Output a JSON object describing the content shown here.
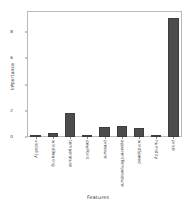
{
  "chart_data": {
    "type": "bar",
    "title": "",
    "xlabel": "Features",
    "ylabel": "Importance",
    "categories": [
      "visibility",
      "windBearing",
      "temperature",
      "dewPoint",
      "pressure",
      "apparentTemperature",
      "windSpeed",
      "humidity",
      "price"
    ],
    "values": [
      0.12,
      0.3,
      1.85,
      0.18,
      0.78,
      0.85,
      0.65,
      0.02,
      9.1
    ],
    "ylim": [
      0,
      9.6
    ],
    "yticks": [
      0,
      2,
      4,
      6,
      8
    ],
    "ytick_labels": [
      "0",
      "2",
      "4",
      "6",
      "8"
    ],
    "grid": false,
    "legend": null,
    "bar_color": "#4c4c4c",
    "frame_color": "#b9b9b9",
    "text_color": "#3b3b3b"
  }
}
